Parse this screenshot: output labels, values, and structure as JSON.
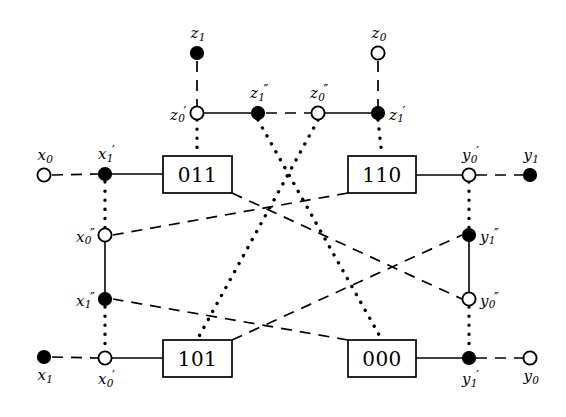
{
  "figure": {
    "type": "butterfly-network-diagram",
    "width": 566,
    "height": 417,
    "background": "#ffffff",
    "ink": "#000000"
  },
  "nodes": [
    {
      "id": "z1",
      "label": "z",
      "sub": "1",
      "prime": "",
      "x": 197,
      "y": 53,
      "fill": "solid",
      "label_pos": "above"
    },
    {
      "id": "z0",
      "label": "z",
      "sub": "0",
      "prime": "",
      "x": 378,
      "y": 53,
      "fill": "open",
      "label_pos": "above"
    },
    {
      "id": "z0p",
      "label": "z",
      "sub": "0",
      "prime": "′",
      "x": 197,
      "y": 113,
      "fill": "open",
      "label_pos": "left"
    },
    {
      "id": "z1pp",
      "label": "z",
      "sub": "1",
      "prime": "″",
      "x": 258,
      "y": 113,
      "fill": "solid",
      "label_pos": "above"
    },
    {
      "id": "z0pp",
      "label": "z",
      "sub": "0",
      "prime": "″",
      "x": 318,
      "y": 113,
      "fill": "open",
      "label_pos": "above"
    },
    {
      "id": "z1p",
      "label": "z",
      "sub": "1",
      "prime": "′",
      "x": 378,
      "y": 113,
      "fill": "solid",
      "label_pos": "right"
    },
    {
      "id": "x0",
      "label": "x",
      "sub": "0",
      "prime": "",
      "x": 44,
      "y": 175,
      "fill": "open",
      "label_pos": "above"
    },
    {
      "id": "x1p",
      "label": "x",
      "sub": "1",
      "prime": "′",
      "x": 105,
      "y": 174,
      "fill": "solid",
      "label_pos": "above"
    },
    {
      "id": "x0pp",
      "label": "x",
      "sub": "0",
      "prime": "″",
      "x": 105,
      "y": 235,
      "fill": "open",
      "label_pos": "left"
    },
    {
      "id": "x1pp",
      "label": "x",
      "sub": "1",
      "prime": "″",
      "x": 105,
      "y": 299,
      "fill": "solid",
      "label_pos": "left"
    },
    {
      "id": "x0p",
      "label": "x",
      "sub": "0",
      "prime": "′",
      "x": 105,
      "y": 358,
      "fill": "open",
      "label_pos": "below"
    },
    {
      "id": "x1",
      "label": "x",
      "sub": "1",
      "prime": "",
      "x": 44,
      "y": 357,
      "fill": "solid",
      "label_pos": "below"
    },
    {
      "id": "y0p",
      "label": "y",
      "sub": "0",
      "prime": "′",
      "x": 469,
      "y": 175,
      "fill": "open",
      "label_pos": "above"
    },
    {
      "id": "y1",
      "label": "y",
      "sub": "1",
      "prime": "",
      "x": 530,
      "y": 175,
      "fill": "solid",
      "label_pos": "above"
    },
    {
      "id": "y1pp",
      "label": "y",
      "sub": "1",
      "prime": "″",
      "x": 469,
      "y": 235,
      "fill": "solid",
      "label_pos": "right"
    },
    {
      "id": "y0pp",
      "label": "y",
      "sub": "0",
      "prime": "″",
      "x": 469,
      "y": 299,
      "fill": "open",
      "label_pos": "right"
    },
    {
      "id": "y1p",
      "label": "y",
      "sub": "1",
      "prime": "′",
      "x": 469,
      "y": 358,
      "fill": "solid",
      "label_pos": "below"
    },
    {
      "id": "y0",
      "label": "y",
      "sub": "0",
      "prime": "",
      "x": 530,
      "y": 358,
      "fill": "open",
      "label_pos": "below"
    }
  ],
  "boxes": [
    {
      "id": "box011",
      "text": "011",
      "x": 163,
      "y": 156,
      "w": 69,
      "h": 37
    },
    {
      "id": "box110",
      "text": "110",
      "x": 348,
      "y": 156,
      "w": 68,
      "h": 37
    },
    {
      "id": "box101",
      "text": "101",
      "x": 163,
      "y": 340,
      "w": 69,
      "h": 37
    },
    {
      "id": "box000",
      "text": "000",
      "x": 348,
      "y": 340,
      "w": 68,
      "h": 37
    }
  ],
  "edges": [
    {
      "id": "e-x0-x1p",
      "style": "dashed",
      "from": [
        52,
        175
      ],
      "to": [
        98,
        174
      ]
    },
    {
      "id": "e-x1p-box011",
      "style": "solid",
      "from": [
        112,
        174
      ],
      "to": [
        163,
        174
      ]
    },
    {
      "id": "e-x1p-x0pp",
      "style": "dotted",
      "from": [
        105,
        182
      ],
      "to": [
        105,
        228
      ]
    },
    {
      "id": "e-x0pp-x1pp",
      "style": "solid",
      "from": [
        105,
        242
      ],
      "to": [
        105,
        292
      ]
    },
    {
      "id": "e-x1pp-x0p",
      "style": "dotted",
      "from": [
        105,
        307
      ],
      "to": [
        105,
        351
      ]
    },
    {
      "id": "e-x1-x0p",
      "style": "dashed",
      "from": [
        52,
        357
      ],
      "to": [
        98,
        358
      ]
    },
    {
      "id": "e-x0p-box101",
      "style": "solid",
      "from": [
        112,
        358
      ],
      "to": [
        163,
        358
      ]
    },
    {
      "id": "e-z1-z0p",
      "style": "dashed",
      "from": [
        197,
        61
      ],
      "to": [
        197,
        106
      ]
    },
    {
      "id": "e-z0p-z1pp",
      "style": "solid",
      "from": [
        204,
        113
      ],
      "to": [
        251,
        113
      ]
    },
    {
      "id": "e-z1pp-z0pp",
      "style": "dashed",
      "from": [
        266,
        113
      ],
      "to": [
        311,
        113
      ]
    },
    {
      "id": "e-z0pp-z1p",
      "style": "solid",
      "from": [
        325,
        113
      ],
      "to": [
        371,
        113
      ]
    },
    {
      "id": "e-z0-z1p",
      "style": "dashed",
      "from": [
        378,
        61
      ],
      "to": [
        378,
        106
      ]
    },
    {
      "id": "e-z0p-box011",
      "style": "dotted",
      "from": [
        197,
        120
      ],
      "to": [
        197,
        156
      ]
    },
    {
      "id": "e-z1p-box110",
      "style": "dotted",
      "from": [
        378,
        120
      ],
      "to": [
        382,
        156
      ]
    },
    {
      "id": "e-y0p-y1",
      "style": "dashed",
      "from": [
        476,
        175
      ],
      "to": [
        523,
        175
      ]
    },
    {
      "id": "e-box110-y0p",
      "style": "solid",
      "from": [
        416,
        175
      ],
      "to": [
        462,
        175
      ]
    },
    {
      "id": "e-y0p-y1pp",
      "style": "dotted",
      "from": [
        469,
        182
      ],
      "to": [
        469,
        228
      ]
    },
    {
      "id": "e-y1pp-y0pp",
      "style": "solid",
      "from": [
        469,
        242
      ],
      "to": [
        469,
        292
      ]
    },
    {
      "id": "e-y0pp-y1p",
      "style": "dotted",
      "from": [
        469,
        307
      ],
      "to": [
        469,
        351
      ]
    },
    {
      "id": "e-y1p-y0",
      "style": "dashed",
      "from": [
        476,
        358
      ],
      "to": [
        523,
        358
      ]
    },
    {
      "id": "e-box000-y1p",
      "style": "solid",
      "from": [
        416,
        358
      ],
      "to": [
        462,
        358
      ]
    },
    {
      "id": "e-z1pp-box000",
      "style": "dotted",
      "from": [
        258,
        120
      ],
      "to": [
        382,
        340
      ]
    },
    {
      "id": "e-z0pp-box101",
      "style": "dotted",
      "from": [
        318,
        120
      ],
      "to": [
        197,
        340
      ]
    },
    {
      "id": "e-box011-y0pp",
      "style": "dashed",
      "from": [
        232,
        193
      ],
      "to": [
        462,
        299
      ]
    },
    {
      "id": "e-box110-x0pp",
      "style": "dashed",
      "from": [
        348,
        193
      ],
      "to": [
        113,
        235
      ]
    },
    {
      "id": "e-box101-y1pp",
      "style": "dashed",
      "from": [
        232,
        340
      ],
      "to": [
        462,
        235
      ]
    },
    {
      "id": "e-box000-x1pp",
      "style": "dashed",
      "from": [
        348,
        340
      ],
      "to": [
        113,
        299
      ]
    }
  ]
}
